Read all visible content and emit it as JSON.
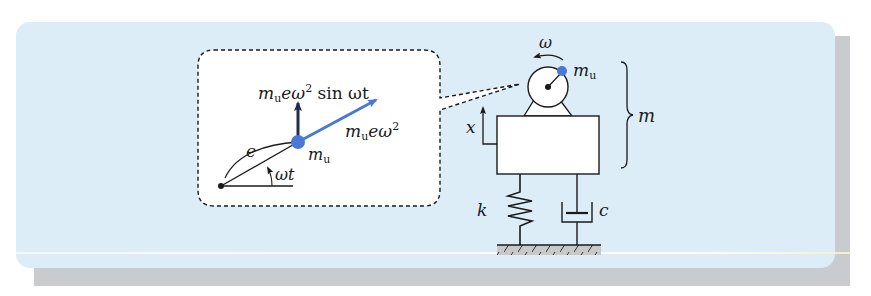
{
  "figure": {
    "colors": {
      "panel_background": "#dcedf8",
      "shadow": "#c9ccce",
      "accent_blue": "#4a78d6",
      "dark_arrow": "#1f2d4a",
      "ink": "#1a1a1a"
    }
  },
  "inset": {
    "vertical_force_label": {
      "m": "m",
      "sub": "u",
      "rest": "eω",
      "sup": "2",
      "trail": " sin ωt"
    },
    "radial_force_label": {
      "m": "m",
      "sub": "u",
      "rest": "eω",
      "sup": "2"
    },
    "mass_label": {
      "m": "m",
      "sub": "u"
    },
    "eccentricity_label": "e",
    "angle_label": "ωt"
  },
  "machine": {
    "rotation_label": "ω",
    "unbalance_mass_label": {
      "m": "m",
      "sub": "u"
    },
    "total_mass_label": "m",
    "displacement_label": "x",
    "spring_label": "k",
    "damper_label": "c"
  }
}
